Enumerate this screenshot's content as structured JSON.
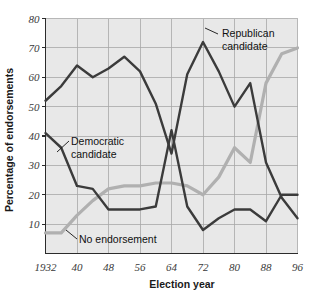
{
  "chart_data": {
    "type": "line",
    "title": "",
    "xlabel": "Election year",
    "ylabel": "Percentage of endorsements",
    "xlim": [
      1932,
      1996
    ],
    "ylim": [
      0,
      80
    ],
    "yticks": [
      10,
      20,
      30,
      40,
      50,
      60,
      70,
      80
    ],
    "xticks": [
      1932,
      1940,
      1948,
      1956,
      1964,
      1972,
      1980,
      1988,
      1996
    ],
    "xtick_labels": [
      "1932",
      "40",
      "48",
      "56",
      "64",
      "72",
      "80",
      "88",
      "96"
    ],
    "ytick_labels": [
      "10",
      "20",
      "30",
      "40",
      "50",
      "60",
      "70",
      "80"
    ],
    "grid": true,
    "legend_position": "inline-annotations",
    "x": [
      1932,
      1936,
      1940,
      1944,
      1948,
      1952,
      1956,
      1960,
      1964,
      1968,
      1972,
      1976,
      1980,
      1984,
      1988,
      1992,
      1996
    ],
    "series": [
      {
        "name": "Republican candidate",
        "color": "#3b3b3b",
        "values": [
          52,
          57,
          64,
          60,
          63,
          67,
          62,
          51,
          34,
          61,
          72,
          62,
          50,
          58,
          31,
          19,
          12
        ]
      },
      {
        "name": "Democratic candidate",
        "color": "#3b3b3b",
        "values": [
          41,
          36,
          23,
          22,
          15,
          15,
          15,
          16,
          42,
          16,
          8,
          12,
          15,
          15,
          11,
          20,
          20
        ]
      },
      {
        "name": "No endorsement",
        "color": "#b0b0b0",
        "values": [
          7,
          7,
          13,
          18,
          22,
          23,
          23,
          24,
          24,
          23,
          20,
          26,
          36,
          31,
          58,
          68,
          70
        ]
      }
    ],
    "annotations": [
      {
        "text_line1": "Republican",
        "text_line2": "candidate",
        "series": "Republican candidate",
        "anchor_x": 1972,
        "anchor_y": 72
      },
      {
        "text_line1": "Democratic",
        "text_line2": "candidate",
        "series": "Democratic candidate",
        "anchor_x": 1937,
        "anchor_y": 35
      },
      {
        "text_line1": "No endorsement",
        "text_line2": "",
        "series": "No endorsement",
        "anchor_x": 1936,
        "anchor_y": 7
      }
    ]
  },
  "labels": {
    "xaxis_title": "Election year",
    "yaxis_title": "Percentage of endorsements",
    "republican_line1": "Republican",
    "republican_line2": "candidate",
    "democratic_line1": "Democratic",
    "democratic_line2": "candidate",
    "no_endorsement": "No endorsement",
    "x_1932": "1932",
    "x_1940": "40",
    "x_1948": "48",
    "x_1956": "56",
    "x_1964": "64",
    "x_1972": "72",
    "x_1980": "80",
    "x_1988": "88",
    "x_1996": "96",
    "y_10": "10",
    "y_20": "20",
    "y_30": "30",
    "y_40": "40",
    "y_50": "50",
    "y_60": "60",
    "y_70": "70",
    "y_80": "80"
  },
  "colors": {
    "plot_background": "#e8e8e8",
    "page_background": "#ffffff",
    "grid": "#a8a8a8",
    "axis": "#2b2b2b",
    "dark_series": "#3b3b3b",
    "light_series": "#b0b0b0",
    "text": "#1a1a1a"
  }
}
